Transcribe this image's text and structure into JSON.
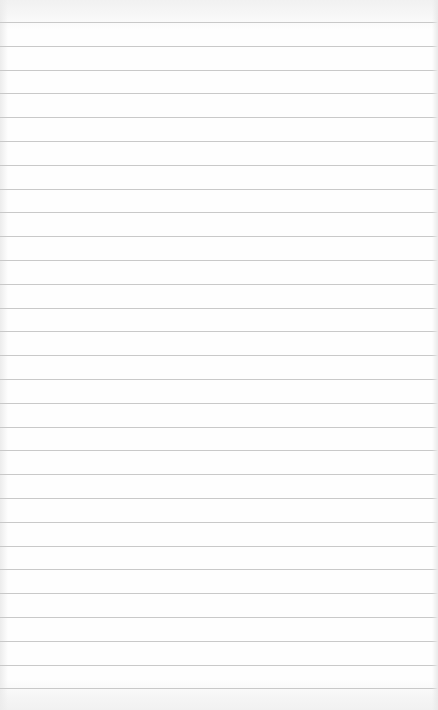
{
  "page": {
    "background_color": "#fdfdfd",
    "rule_color": "#c9c9c9"
  },
  "rules": {
    "count": 29,
    "first_y": 22,
    "spacing": 23.8
  }
}
